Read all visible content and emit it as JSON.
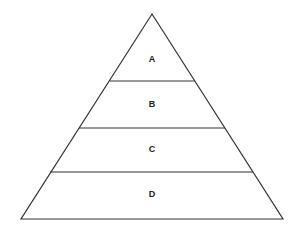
{
  "diagram": {
    "type": "pyramid",
    "levels": [
      {
        "label": "A"
      },
      {
        "label": "B"
      },
      {
        "label": "C"
      },
      {
        "label": "D"
      }
    ],
    "colors": {
      "stroke": "#333333",
      "text": "#222222",
      "fill": "#ffffff"
    }
  }
}
